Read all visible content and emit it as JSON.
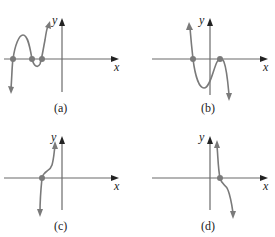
{
  "panels": [
    {
      "id": "a",
      "caption": "(a)",
      "x_label": "x",
      "y_label": "y",
      "zeros": 3,
      "description": "Cubic-like curve falling to -inf on left, rising to +inf on right; three x-intercepts left of y-axis"
    },
    {
      "id": "b",
      "caption": "(b)",
      "x_label": "x",
      "y_label": "y",
      "zeros": 2,
      "description": "Curve from +inf on left, dips below axis, touches axis at a double root right of y-axis, falls to -inf"
    },
    {
      "id": "c",
      "caption": "(c)",
      "x_label": "x",
      "y_label": "y",
      "zeros": 1,
      "description": "Increasing curve with inflection near single x-intercept left of y-axis"
    },
    {
      "id": "d",
      "caption": "(d)",
      "x_label": "x",
      "y_label": "y",
      "zeros": 1,
      "description": "Decreasing curve with inflection near single x-intercept right of y-axis"
    }
  ],
  "colors": {
    "axis": "#6b6b6b",
    "curve": "#7a7a7a",
    "text": "#222222"
  }
}
